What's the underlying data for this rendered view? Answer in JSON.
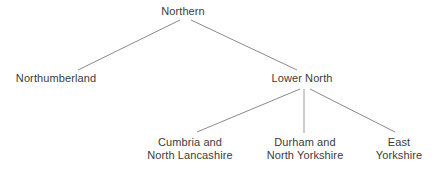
{
  "diagram": {
    "type": "hierarchy-tree",
    "orientation": "top-down",
    "background_color": "#ffffff",
    "text_color": "#3b3b3b",
    "edge_color": "#8a8a8a",
    "nodes": {
      "root": {
        "id": "northern",
        "label": "Northern",
        "lines": [
          "Northern"
        ],
        "level": 0,
        "center_x": 183,
        "top_y": 5
      },
      "northumberland": {
        "id": "northumberland",
        "label": "Northumberland",
        "lines": [
          "Northumberland"
        ],
        "level": 1,
        "center_x": 56,
        "top_y": 72
      },
      "lower_north": {
        "id": "lower-north",
        "label": "Lower North",
        "lines": [
          "Lower North"
        ],
        "level": 1,
        "center_x": 302,
        "top_y": 72
      },
      "cumbria": {
        "id": "cumbria-and-north-lancashire",
        "label": "Cumbria and North Lancashire",
        "lines": [
          "Cumbria and",
          "North Lancashire"
        ],
        "level": 2,
        "center_x": 190,
        "top_y": 136
      },
      "durham": {
        "id": "durham-and-north-yorkshire",
        "label": "Durham and North Yorkshire",
        "lines": [
          "Durham and",
          "North Yorkshire"
        ],
        "level": 2,
        "center_x": 305,
        "top_y": 136
      },
      "east_yorkshire": {
        "id": "east-yorkshire",
        "label": "East Yorkshire",
        "lines": [
          "East",
          "Yorkshire"
        ],
        "level": 2,
        "center_x": 399,
        "top_y": 136
      }
    },
    "edges": [
      {
        "id": "northern-to-northumberland",
        "from": "Northern",
        "to": "Northumberland",
        "x1": 180,
        "y1": 20,
        "x2": 78,
        "y2": 70
      },
      {
        "id": "northern-to-lower-north",
        "from": "Northern",
        "to": "Lower North",
        "x1": 191,
        "y1": 20,
        "x2": 297,
        "y2": 70
      },
      {
        "id": "lower-north-to-cumbria",
        "from": "Lower North",
        "to": "Cumbria and North Lancashire",
        "x1": 300,
        "y1": 89,
        "x2": 197,
        "y2": 132
      },
      {
        "id": "lower-north-to-durham",
        "from": "Lower North",
        "to": "Durham and North Yorkshire",
        "x1": 304,
        "y1": 89,
        "x2": 304,
        "y2": 133
      },
      {
        "id": "lower-north-to-east-yorkshire",
        "from": "Lower North",
        "to": "East Yorkshire",
        "x1": 310,
        "y1": 89,
        "x2": 395,
        "y2": 132
      }
    ]
  }
}
